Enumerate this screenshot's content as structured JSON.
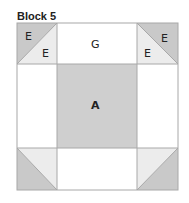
{
  "title": "Block 5",
  "colors": {
    "dark": "#c9c9c9",
    "light": "#ececec",
    "white": "#ffffff",
    "center": "#cfcfcf",
    "line": "#a8a8a8"
  },
  "pieces": {
    "top_left_dark": "E",
    "top_left_light": "E",
    "top_center": "G",
    "top_right_dark": "E",
    "top_right_light": "E",
    "center": "A"
  }
}
